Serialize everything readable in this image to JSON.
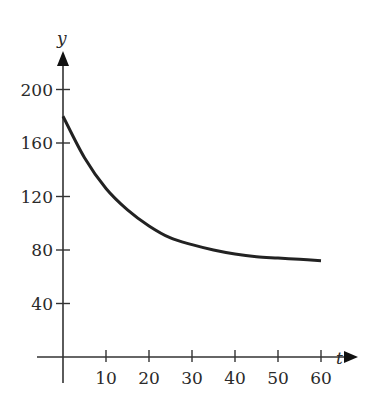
{
  "chart_data": {
    "type": "line",
    "title": "",
    "xlabel": "t",
    "ylabel": "y",
    "xlim": [
      0,
      60
    ],
    "ylim": [
      0,
      200
    ],
    "grid": false,
    "legend": null,
    "x_ticks": [
      10,
      20,
      30,
      40,
      50,
      60
    ],
    "y_ticks": [
      40,
      80,
      120,
      160,
      200
    ],
    "x_tick_labels": [
      "10",
      "20",
      "30",
      "40",
      "50",
      "60"
    ],
    "y_tick_labels": [
      "40",
      "80",
      "120",
      "160",
      "200"
    ],
    "series": [
      {
        "name": "y(t)",
        "x": [
          0,
          5,
          10,
          15,
          20,
          25,
          30,
          35,
          40,
          45,
          50,
          55,
          60
        ],
        "values": [
          180,
          149,
          126,
          110,
          98,
          89,
          84,
          80,
          77,
          75,
          74,
          73,
          72
        ]
      }
    ],
    "color": "#222222"
  }
}
